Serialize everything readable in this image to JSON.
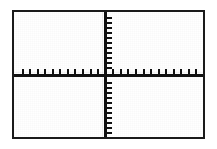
{
  "screen": {
    "device": "graphing-calculator",
    "title": "Graphing calculator viewing window",
    "background_color": "#ffffff",
    "ink_color": "#111111",
    "frame_color": "#1a1a1a"
  },
  "chart_data": {
    "type": "scatter",
    "title": "",
    "subtitle": "",
    "xlabel": "",
    "ylabel": "",
    "xlim": [
      -10,
      10
    ],
    "ylim": [
      -10,
      10
    ],
    "xtick_step": 1,
    "ytick_step": 1,
    "grid": false,
    "legend": "none",
    "axes_visible": true,
    "tick_marks_visible": true,
    "x_tick_count": 24,
    "y_tick_count": 24,
    "x_tick_values": [
      -10,
      -9,
      -8,
      -7,
      -6,
      -5,
      -4,
      -3,
      -2,
      -1,
      1,
      2,
      3,
      4,
      5,
      6,
      7,
      8,
      9,
      10
    ],
    "y_tick_values": [
      -10,
      -9,
      -8,
      -7,
      -6,
      -5,
      -4,
      -3,
      -2,
      -1,
      1,
      2,
      3,
      4,
      5,
      6,
      7,
      8,
      9,
      10
    ],
    "tick_labels_visible": false,
    "series": [],
    "x": [],
    "values": [],
    "annotations": [],
    "note": "Empty standard viewing window: axes and tick marks only, no curve or data plotted."
  }
}
